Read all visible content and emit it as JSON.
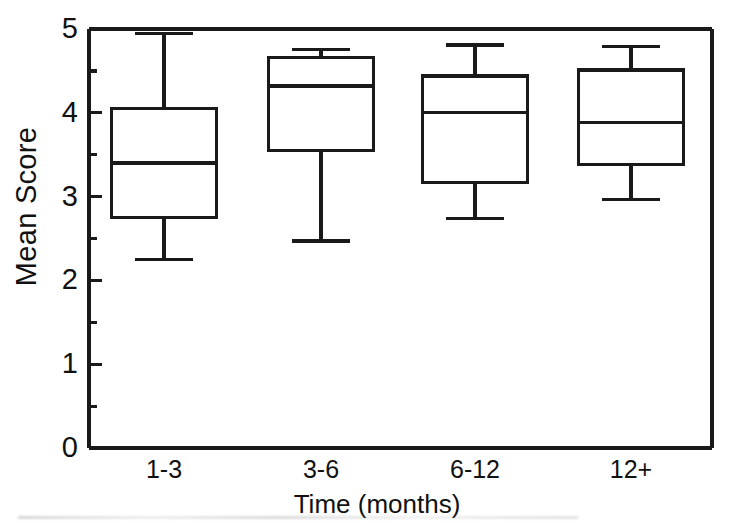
{
  "chart_data": {
    "type": "box",
    "title": "",
    "xlabel": "Time (months)",
    "ylabel": "Mean Score",
    "categories": [
      "1-3",
      "3-6",
      "6-12",
      "12+"
    ],
    "ylim": [
      0,
      5
    ],
    "xlim_note": "categorical, 4 groups evenly spaced",
    "y_major_ticks": [
      "0",
      "1",
      "2",
      "3",
      "4",
      "5"
    ],
    "y_minor_ticks": [
      0.5,
      1.5,
      2.5,
      3.5,
      4.5
    ],
    "grid": false,
    "legend": false,
    "boxes": [
      {
        "category": "1-3",
        "whisker_low": 2.25,
        "q1": 2.75,
        "median": 3.4,
        "q3": 4.05,
        "whisker_high": 4.95
      },
      {
        "category": "3-6",
        "whisker_low": 2.47,
        "q1": 3.55,
        "median": 4.32,
        "q3": 4.66,
        "whisker_high": 4.76
      },
      {
        "category": "6-12",
        "whisker_low": 2.74,
        "q1": 3.17,
        "median": 4.0,
        "q3": 4.44,
        "whisker_high": 4.81
      },
      {
        "category": "12+",
        "whisker_low": 2.97,
        "q1": 3.38,
        "median": 3.88,
        "q3": 4.51,
        "whisker_high": 4.79
      }
    ],
    "colors": {
      "line": "#1a1a1a",
      "fill": "#ffffff",
      "background": "#ffffff"
    }
  },
  "axes": {
    "y_title": "Mean Score",
    "x_title": "Time (months)",
    "y_labels": [
      "5",
      "4",
      "3",
      "2",
      "1",
      "0"
    ],
    "x_labels": [
      "1-3",
      "3-6",
      "6-12",
      "12+"
    ]
  }
}
